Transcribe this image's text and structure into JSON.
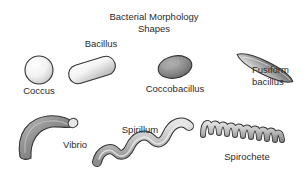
{
  "figure": {
    "background_color": "#ffffff",
    "width": 308,
    "height": 177,
    "title_line1": "Bacterial Morphology",
    "title_line2": "Shapes",
    "bottom_cut_text": ""
  },
  "labels": {
    "coccus": "Coccus",
    "bacillus": "Bacillus",
    "coccobacillus": "Coccobacillus",
    "fusiform_line1": "Fusiform",
    "fusiform_line2": "bacillus",
    "vibrio": "Vibrio",
    "spirillum": "Spirillum",
    "spirochete": "Spirochete"
  },
  "colors": {
    "outline": "#333333",
    "text": "#2b2b2b",
    "coccus_light": "#ffffff",
    "coccus_dark": "#c9c9c9",
    "bacillus_light": "#ffffff",
    "bacillus_dark": "#c4c4c4",
    "coccobacillus_light": "#b0b0b0",
    "coccobacillus_dark": "#636363",
    "fusiform_light": "#ffffff",
    "fusiform_dark": "#4a4a4a",
    "vibrio_light": "#b5b5b5",
    "vibrio_dark": "#6e6e6e",
    "spirillum_light": "#dcdcdc",
    "spirillum_dark": "#909090",
    "spirochete_light": "#d8d8d8",
    "spirochete_dark": "#8d8d8d"
  },
  "shapes": [
    {
      "name": "coccus",
      "type": "circle",
      "description": "spherical cell",
      "cx": 39,
      "cy": 70,
      "r": 14
    },
    {
      "name": "bacillus",
      "type": "capsule",
      "description": "rod-shaped cell, rounded ends, tilted",
      "cx": 92,
      "cy": 70,
      "length": 48,
      "thickness": 19,
      "rotation": -17
    },
    {
      "name": "coccobacillus",
      "type": "ellipse",
      "description": "short oval rod",
      "cx": 175,
      "cy": 67,
      "rx": 17,
      "ry": 11,
      "rotation": -12
    },
    {
      "name": "fusiform-bacillus",
      "type": "spindle",
      "description": "tapered pointed spindle, diagonal",
      "cx": 265,
      "cy": 68,
      "length": 62,
      "thickness": 16,
      "rotation": -62
    },
    {
      "name": "vibrio",
      "type": "comma",
      "description": "curved comma-shaped rod",
      "cx": 48,
      "cy": 137
    },
    {
      "name": "spirillum",
      "type": "wave",
      "description": "thick rigid spiral with large wavelength",
      "cycles": 2.5,
      "amplitude": 13,
      "thickness": 8
    },
    {
      "name": "spirochete",
      "type": "helix",
      "description": "tight flexible corkscrew helix",
      "coils": 9,
      "amplitude": 11,
      "thickness": 4
    }
  ]
}
